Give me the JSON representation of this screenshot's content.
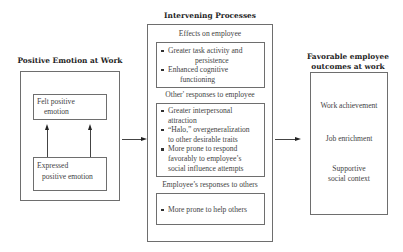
{
  "left": {
    "title": "Positive Emotion at Work",
    "felt": [
      "Felt positive",
      "emotion"
    ],
    "expressed": [
      "Expressed",
      "positive emotion"
    ]
  },
  "middle": {
    "title": "Intervening Processes",
    "sections": [
      {
        "heading": "Effects on employee",
        "bullets": [
          [
            "Greater task activity and",
            "persistence"
          ],
          [
            "Enhanced cognitive",
            "functioning"
          ]
        ]
      },
      {
        "heading": "Other' responses to employee",
        "bullets": [
          [
            "Greater interpersonal",
            "attraction"
          ],
          [
            "“Halo,” overgeneralization",
            "to other desirable traits"
          ],
          [
            "More prone to respond",
            "favorably to employee’s",
            "social influence attempts"
          ]
        ]
      },
      {
        "heading": "Employee’s responses to others",
        "bullets": [
          [
            "More prone to help others"
          ]
        ]
      }
    ]
  },
  "right": {
    "title": [
      "Favorable employee",
      "outcomes at work"
    ],
    "items": [
      "Work achievement",
      "Job enrichment",
      [
        "Supportive",
        "social context"
      ]
    ]
  },
  "colors": {
    "border": "#6e6e6e",
    "arrow": "#222222",
    "text": "#444444",
    "title": "#1e1e1e"
  },
  "icons": {
    "arrows": [
      "arrow-up-icon",
      "arrow-up-icon",
      "arrow-right-icon",
      "arrow-right-icon"
    ]
  }
}
